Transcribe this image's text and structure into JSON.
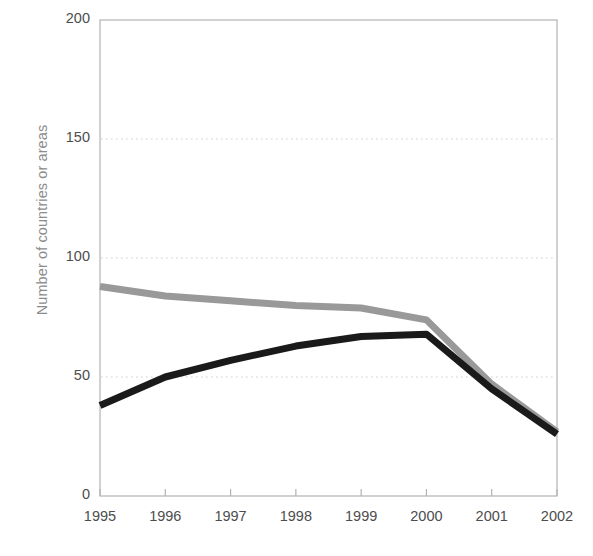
{
  "chart_data": {
    "type": "line",
    "title": "",
    "subtitle": "",
    "xlabel": "",
    "ylabel": "Number of countries or areas",
    "x": [
      "1995",
      "1996",
      "1997",
      "1998",
      "1999",
      "2000",
      "2001",
      "2002"
    ],
    "categories": [
      "1995",
      "1996",
      "1997",
      "1998",
      "1999",
      "2000",
      "2001",
      "2002"
    ],
    "series": [
      {
        "name": "gray-series",
        "color": "#999999",
        "values": [
          88,
          84,
          82,
          80,
          79,
          74,
          47,
          27
        ]
      },
      {
        "name": "black-series",
        "color": "#1a1a1a",
        "values": [
          38,
          50,
          57,
          63,
          67,
          68,
          45,
          26
        ]
      }
    ],
    "ylim": [
      0,
      200
    ],
    "yticks": [
      "0",
      "50",
      "100",
      "150",
      "200"
    ],
    "ytick_values": [
      0,
      50,
      100,
      150,
      200
    ],
    "xticks": [
      "1995",
      "1996",
      "1997",
      "1998",
      "1999",
      "2000",
      "2001",
      "2002"
    ],
    "grid": "horizontal-dotted",
    "gridlines_at": [
      50,
      100,
      150
    ],
    "legend": "none",
    "legend_position": "none",
    "annotations": []
  },
  "axis_colors": {
    "frame": "#b3b3b3",
    "gridline": "#e0e0e0",
    "tick_text": "#4d4d4d",
    "axis_label_text": "#8c8c8c"
  },
  "plot_geometry": {
    "left": 100,
    "right": 557,
    "top": 20,
    "bottom": 496
  }
}
